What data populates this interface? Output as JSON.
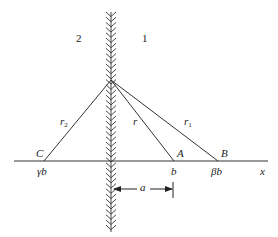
{
  "diagram": {
    "regions": [
      {
        "id": "region-2",
        "label": "2"
      },
      {
        "id": "region-1",
        "label": "1"
      }
    ],
    "points": {
      "C": {
        "label": "C",
        "coord": "γb"
      },
      "A": {
        "label": "A",
        "coord": "b"
      },
      "B": {
        "label": "B",
        "coord": "βb"
      }
    },
    "segments": {
      "r2": {
        "base": "r",
        "sub": "2"
      },
      "r": {
        "base": "r",
        "sub": ""
      },
      "r1": {
        "base": "r",
        "sub": "1"
      }
    },
    "axis_label": "x",
    "distance_label": "a",
    "colors": {
      "line": "#333333",
      "background": "#ffffff"
    }
  }
}
